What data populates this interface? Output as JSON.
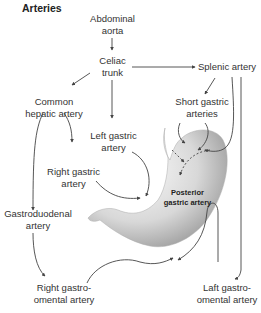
{
  "title": "Arteries",
  "nodes": {
    "aorta": [
      "Abdominal",
      "aorta"
    ],
    "celiac": [
      "Celiac",
      "trunk"
    ],
    "splenic": [
      "Splenic artery"
    ],
    "common_hepatic": [
      "Common",
      "hepatic artery"
    ],
    "short_gastric": [
      "Short gastric",
      "arteries"
    ],
    "left_gastric": [
      "Left gastric",
      "artery"
    ],
    "right_gastric": [
      "Right gastric",
      "artery"
    ],
    "posterior_gastric": [
      "Posterior",
      "gastric artery"
    ],
    "gastroduodenal": [
      "Gastroduodenal",
      "artery"
    ],
    "right_gastroomental": [
      "Right gastro-",
      "omental artery"
    ],
    "left_gastroomental": [
      "Laft gastro-",
      "omental artery"
    ]
  },
  "colors": {
    "line": "#444444",
    "stomach_light": "#f2f2f2",
    "stomach_dark": "#9a9a9a"
  }
}
